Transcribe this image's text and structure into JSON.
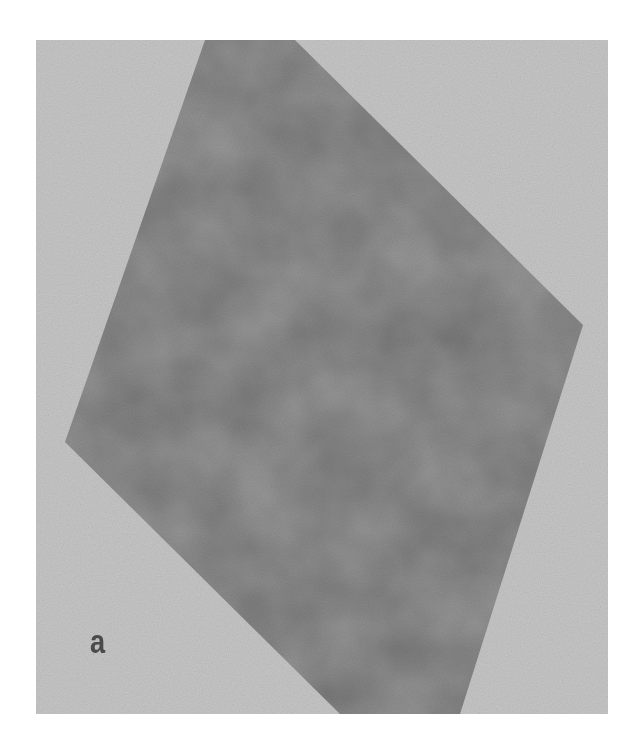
{
  "figure": {
    "panel_label": "a",
    "background_color": "#c4c4c4",
    "flake_color": "#9a9a9a",
    "page_background": "#ffffff"
  }
}
